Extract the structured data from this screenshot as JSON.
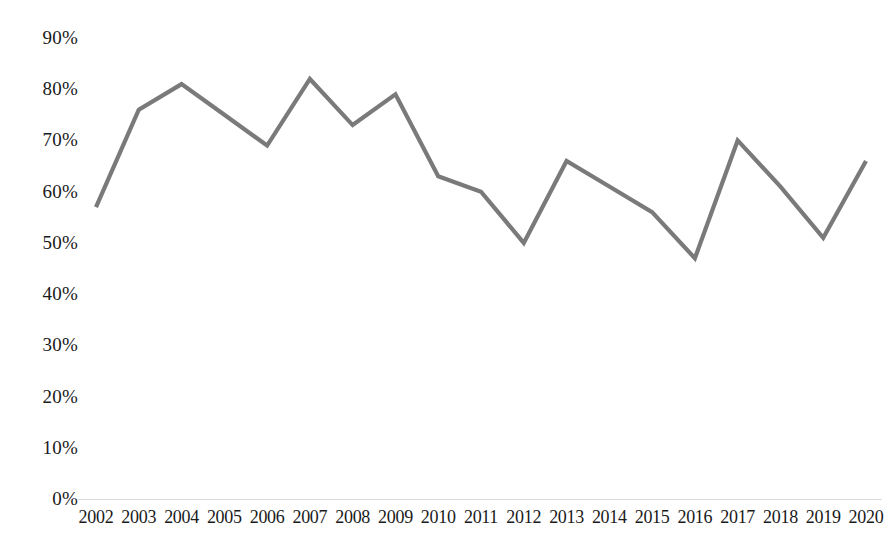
{
  "chart_data": {
    "type": "line",
    "title": "",
    "subtitle": "",
    "xlabel": "",
    "ylabel": "",
    "categories": [
      "2002",
      "2003",
      "2004",
      "2005",
      "2006",
      "2007",
      "2008",
      "2009",
      "2010",
      "2011",
      "2012",
      "2013",
      "2014",
      "2015",
      "2016",
      "2017",
      "2018",
      "2019",
      "2020"
    ],
    "values": [
      57,
      76,
      81,
      75,
      69,
      82,
      73,
      79,
      63,
      60,
      50,
      66,
      61,
      56,
      47,
      70,
      61,
      51,
      66
    ],
    "series": [
      {
        "name": "",
        "values": [
          57,
          76,
          81,
          75,
          69,
          82,
          73,
          79,
          63,
          60,
          50,
          66,
          61,
          56,
          47,
          70,
          61,
          51,
          66
        ]
      }
    ],
    "y_tick_labels": [
      "90%",
      "80%",
      "70%",
      "60%",
      "50%",
      "40%",
      "30%",
      "20%",
      "10%",
      "0%"
    ],
    "y_tick_values": [
      90,
      80,
      70,
      60,
      50,
      40,
      30,
      20,
      10,
      0
    ],
    "ylim": [
      0,
      90
    ],
    "value_suffix": "%",
    "grid": false,
    "legend": false,
    "legend_position": "none",
    "markers": false,
    "line_color": "#7a7a7a",
    "axis_color": "#d9d9d9",
    "text_color": "#1a1a1a",
    "background_color": "#ffffff"
  }
}
